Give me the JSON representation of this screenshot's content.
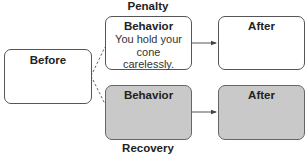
{
  "diagram": {
    "before": {
      "title": "Before"
    },
    "penalty": {
      "label": "Penalty",
      "behavior": {
        "title": "Behavior",
        "text": "You hold your cone carelessly."
      },
      "after": {
        "title": "After"
      }
    },
    "recovery": {
      "label": "Recovery",
      "behavior": {
        "title": "Behavior",
        "text": ""
      },
      "after": {
        "title": "After"
      }
    },
    "colors": {
      "border": "#555555",
      "shaded_fill": "#c9c9c9",
      "unshaded_fill": "#ffffff"
    }
  }
}
